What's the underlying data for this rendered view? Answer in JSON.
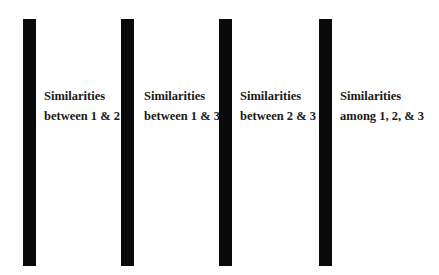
{
  "columns": [
    {
      "line1": "Similarities",
      "line2": "between 1 & 2"
    },
    {
      "line1": "Similarities",
      "line2": "between 1 & 3"
    },
    {
      "line1": "Similarities",
      "line2": "between 2 & 3"
    },
    {
      "line1": "Similarities",
      "line2": "among 1, 2, & 3"
    }
  ],
  "colors": {
    "bar": "#0a0a0a",
    "background": "#ffffff",
    "text": "#1a1a1a"
  }
}
